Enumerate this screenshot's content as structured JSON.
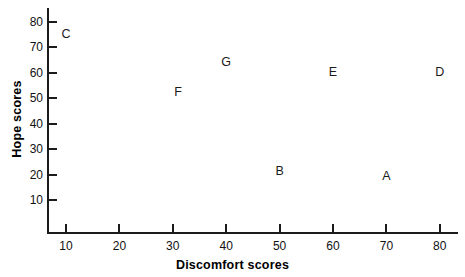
{
  "chart_data": {
    "type": "scatter",
    "title": "",
    "xlabel": "Discomfort scores",
    "ylabel": "Hope scores",
    "xlim": [
      5,
      85
    ],
    "ylim": [
      0,
      87
    ],
    "xticks": [
      10,
      20,
      30,
      40,
      50,
      60,
      70,
      80
    ],
    "yticks": [
      10,
      20,
      30,
      40,
      50,
      60,
      70,
      80
    ],
    "grid": false,
    "legend": "none",
    "marker_style": "text-label",
    "points": [
      {
        "label": "C",
        "x": 10,
        "y": 75
      },
      {
        "label": "F",
        "x": 31,
        "y": 52
      },
      {
        "label": "G",
        "x": 40,
        "y": 64
      },
      {
        "label": "E",
        "x": 60,
        "y": 60
      },
      {
        "label": "D",
        "x": 80,
        "y": 60
      },
      {
        "label": "B",
        "x": 50,
        "y": 21
      },
      {
        "label": "A",
        "x": 70,
        "y": 19
      }
    ],
    "xtick_labels": [
      "10",
      "20",
      "30",
      "40",
      "50",
      "60",
      "70",
      "80"
    ],
    "ytick_labels": [
      "10",
      "20",
      "30",
      "40",
      "50",
      "60",
      "70",
      "80"
    ]
  },
  "colors": {
    "axis": "#1b1b1b",
    "text": "#111111",
    "background": "#ffffff"
  }
}
